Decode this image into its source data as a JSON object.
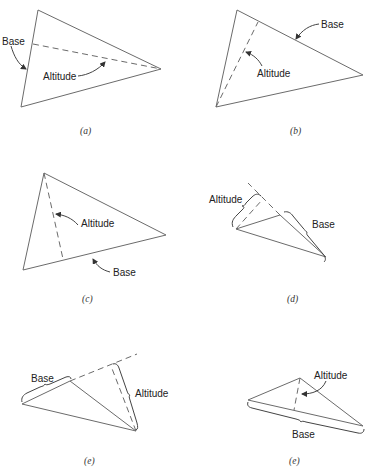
{
  "figure": {
    "panels": [
      {
        "id": "a",
        "caption": "(a)",
        "labels": {
          "base": "Base",
          "altitude": "Altitude"
        }
      },
      {
        "id": "b",
        "caption": "(b)",
        "labels": {
          "base": "Base",
          "altitude": "Altitude"
        }
      },
      {
        "id": "c",
        "caption": "(c)",
        "labels": {
          "base": "Base",
          "altitude": "Altitude"
        }
      },
      {
        "id": "d",
        "caption": "(d)",
        "labels": {
          "base": "Base",
          "altitude": "Altitude"
        }
      },
      {
        "id": "e1",
        "caption": "(e)",
        "labels": {
          "base": "Base",
          "altitude": "Altitude"
        }
      },
      {
        "id": "e2",
        "caption": "(e)",
        "labels": {
          "base": "Base",
          "altitude": "Altitude"
        }
      }
    ]
  },
  "colors": {
    "line": "#6b6b6b",
    "text": "#222222"
  }
}
